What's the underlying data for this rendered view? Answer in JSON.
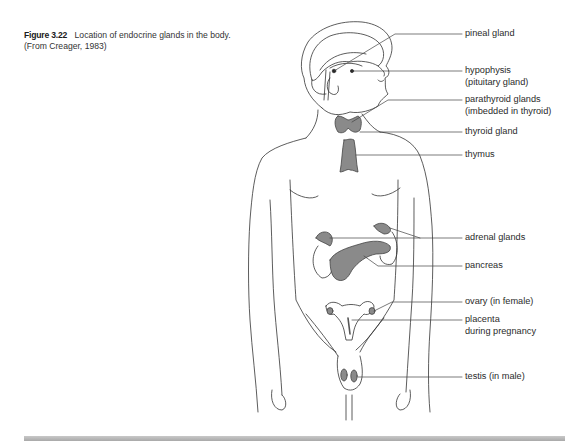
{
  "caption": {
    "figure_number": "Figure 3.22",
    "title": "Location of endocrine glands in the body.",
    "source": "(From Creager, 1983)"
  },
  "labels": [
    {
      "id": "pineal",
      "lines": [
        "pineal gland"
      ]
    },
    {
      "id": "hypophysis",
      "lines": [
        "hypophysis",
        "(pituitary gland)"
      ]
    },
    {
      "id": "parathyroid",
      "lines": [
        "parathyroid glands",
        "(imbedded in thyroid)"
      ]
    },
    {
      "id": "thyroid",
      "lines": [
        "thyroid gland"
      ]
    },
    {
      "id": "thymus",
      "lines": [
        "thymus"
      ]
    },
    {
      "id": "adrenal",
      "lines": [
        "adrenal glands"
      ]
    },
    {
      "id": "pancreas",
      "lines": [
        "pancreas"
      ]
    },
    {
      "id": "ovary",
      "lines": [
        "ovary (in female)"
      ]
    },
    {
      "id": "placenta",
      "lines": [
        "placenta",
        "during pregnancy"
      ]
    },
    {
      "id": "testis",
      "lines": [
        "testis (in male)"
      ]
    }
  ],
  "colors": {
    "gland_fill": "#8a8a8a",
    "outline": "#333333",
    "leader_line": "#444444",
    "bottom_bar": "#b5b5b5"
  }
}
